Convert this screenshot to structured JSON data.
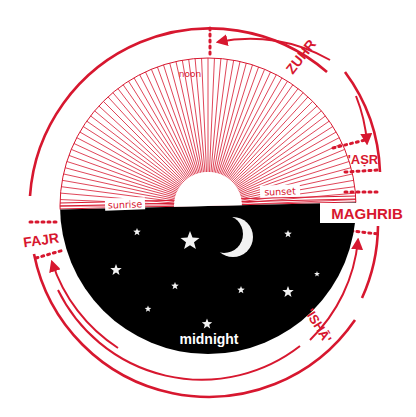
{
  "diagram": {
    "type": "prayer-times-day-dial",
    "colors": {
      "accent": "#d7172f",
      "night": "#000000",
      "star": "#f2f2f2",
      "background": "#ffffff"
    },
    "day_labels": {
      "noon": "noon",
      "sunrise": "sunrise",
      "sunset": "sunset",
      "midnight": "midnight"
    },
    "prayers": [
      {
        "id": "zuhr",
        "label": "ZUHR"
      },
      {
        "id": "asr",
        "label": "'AṢR"
      },
      {
        "id": "maghrib",
        "label": "MAGHRIB"
      },
      {
        "id": "isha",
        "label": "'ISHĀ'"
      },
      {
        "id": "fajr",
        "label": "FAJR"
      }
    ],
    "icons": [
      "sun-icon",
      "crescent-moon-icon",
      "star-icon"
    ]
  }
}
